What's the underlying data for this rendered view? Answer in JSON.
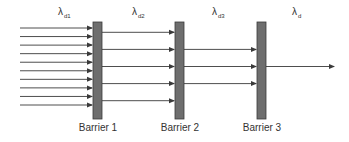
{
  "diagram": {
    "type": "barrier-attenuation",
    "colors": {
      "arrow": "#3a3a3a",
      "barrier_fill": "#6e6e6e",
      "barrier_stroke": "#3a3a3a",
      "text": "#333333"
    },
    "regions": [
      {
        "symbol": "λ",
        "subscript": "d1",
        "arrow_count": 10
      },
      {
        "symbol": "λ",
        "subscript": "d2",
        "arrow_count": 5
      },
      {
        "symbol": "λ",
        "subscript": "d3",
        "arrow_count": 3
      },
      {
        "symbol": "λ",
        "subscript": "d",
        "arrow_count": 1
      }
    ],
    "barriers": [
      {
        "label": "Barrier 1"
      },
      {
        "label": "Barrier 2"
      },
      {
        "label": "Barrier 3"
      }
    ]
  }
}
